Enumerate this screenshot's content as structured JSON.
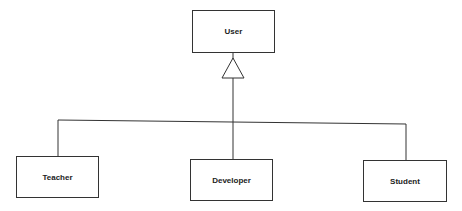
{
  "diagram": {
    "type": "uml-class-inheritance",
    "parent": {
      "label": "User"
    },
    "children": [
      {
        "label": "Teacher"
      },
      {
        "label": "Developer"
      },
      {
        "label": "Student"
      }
    ],
    "relationship": "generalization",
    "colors": {
      "stroke": "#333333",
      "background": "#ffffff",
      "text": "#222222"
    }
  }
}
